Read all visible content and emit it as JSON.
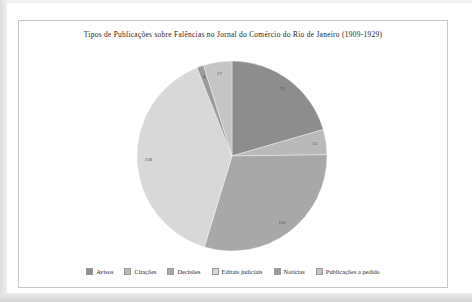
{
  "chart_data": {
    "type": "pie",
    "title": "Tipos de Publicações sobre Falências no Jornal do Comércio do Rio de Janeiro (1909-1929)",
    "categories": [
      "Avisos",
      "Citações",
      "Decisões",
      "Editais judiciais",
      "Notícias",
      "Publicações a pedido"
    ],
    "values": [
      72,
      15,
      105,
      138,
      4,
      17
    ],
    "data_labels": [
      "72",
      "15",
      "105",
      "138",
      "4",
      "17"
    ],
    "colors": [
      "#8d8d8d",
      "#b9b9b9",
      "#a8a8a8",
      "#d8d8d8",
      "#9a9a9a",
      "#c5c5c5"
    ],
    "start_angle_deg": 0,
    "direction": "clockwise",
    "legend_position": "bottom",
    "grid": false
  },
  "page": {
    "background_color": "#ffffff",
    "frame_border_color": "#c6c6c6",
    "text_color": "#1d1d1d"
  }
}
